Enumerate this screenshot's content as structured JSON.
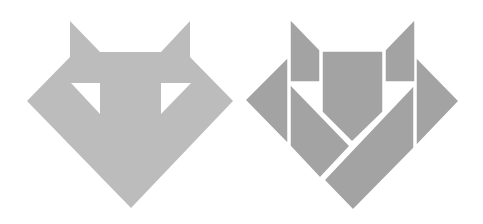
{
  "figure": {
    "colors": {
      "background": "#ffffff",
      "silhouette": "#bcbcbc",
      "pieces": "#a3a3a3",
      "gaps": "#ffffff"
    },
    "panels": [
      {
        "name": "silhouette",
        "description": "Solid fox-head outline with two triangular eye cutouts",
        "outline": [
          [
            70,
            21
          ],
          [
            100,
            52
          ],
          [
            161,
            52
          ],
          [
            190,
            21
          ],
          [
            190,
            57
          ],
          [
            233,
            101
          ],
          [
            131,
            208
          ],
          [
            27,
            101
          ],
          [
            70,
            57
          ]
        ],
        "eyes": [
          [
            [
              71,
              83
            ],
            [
              100,
              83
            ],
            [
              100,
              114
            ]
          ],
          [
            [
              161,
              83
            ],
            [
              191,
              83
            ],
            [
              161,
              114
            ]
          ]
        ]
      },
      {
        "name": "dissection",
        "description": "Same fox head split into seven tangram pieces",
        "pieces": [
          {
            "id": "left-ear",
            "points": [
              [
                290,
                19
              ],
              [
                320,
                50
              ],
              [
                320,
                82
              ],
              [
                290,
                82
              ]
            ]
          },
          {
            "id": "right-ear",
            "points": [
              [
                415,
                19
              ],
              [
                415,
                82
              ],
              [
                385,
                82
              ],
              [
                385,
                50
              ]
            ]
          },
          {
            "id": "center-pentagon",
            "points": [
              [
                322,
                51
              ],
              [
                383,
                51
              ],
              [
                383,
                112
              ],
              [
                352,
                142
              ],
              [
                322,
                112
              ]
            ]
          },
          {
            "id": "left-triangle",
            "points": [
              [
                288,
                57
              ],
              [
                288,
                144
              ],
              [
                245,
                100
              ]
            ]
          },
          {
            "id": "right-triangle",
            "points": [
              [
                416,
                57
              ],
              [
                459,
                101
              ],
              [
                416,
                146
              ]
            ]
          },
          {
            "id": "left-parallelogram",
            "points": [
              [
                290,
                84
              ],
              [
                350,
                146
              ],
              [
                320,
                178
              ],
              [
                290,
                146
              ]
            ]
          },
          {
            "id": "bottom-parallelogram",
            "points": [
              [
                414,
                85
              ],
              [
                414,
                148
              ],
              [
                353,
                210
              ],
              [
                324,
                180
              ]
            ]
          }
        ]
      }
    ]
  }
}
